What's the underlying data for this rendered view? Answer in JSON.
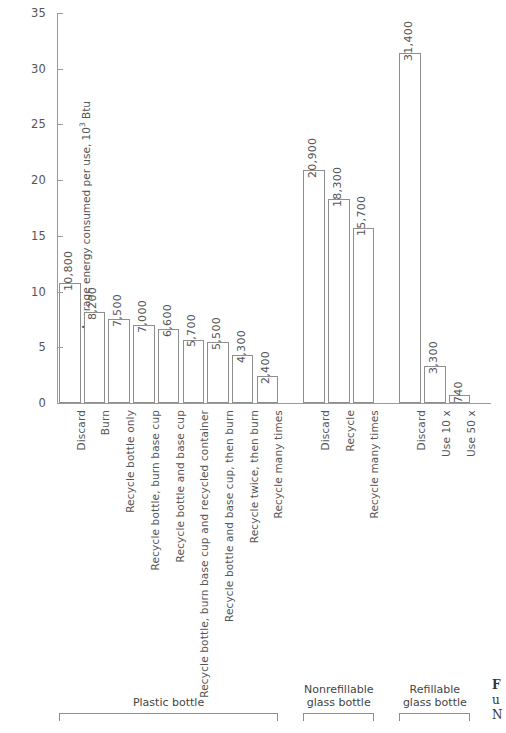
{
  "chart_data": {
    "type": "bar",
    "title": "",
    "xlabel": "",
    "ylabel": "Average energy consumed per use, 10³ Btu",
    "ylim": [
      0,
      35
    ],
    "yticks": [
      0,
      5,
      10,
      15,
      20,
      25,
      30,
      35
    ],
    "ytick_labels": [
      "0",
      "5",
      "10",
      "15",
      "20",
      "25",
      "30",
      "35"
    ],
    "grid": false,
    "legend": "none",
    "value_label_unit": "Btu (values shown in Btu, axis in 10³ Btu)",
    "categories": [
      "Discard",
      "Burn",
      "Recycle bottle only",
      "Recycle bottle, burn base cup",
      "Recycle bottle and base cup",
      "Recycle bottle, burn base cup and recycled container",
      "Recycle bottle and base cup, then burn",
      "Recycle twice, then burn",
      "Recycle many times",
      "Discard",
      "Recycle",
      "Recycle many times",
      "Discard",
      "Use 10 x",
      "Use 50 x"
    ],
    "values": [
      10800,
      8200,
      7500,
      7000,
      6600,
      5700,
      5500,
      4300,
      2400,
      20900,
      18300,
      15700,
      31400,
      3300,
      740
    ],
    "value_labels": [
      "10,800",
      "8,200",
      "7,500",
      "7,000",
      "6,600",
      "5,700",
      "5,500",
      "4,300",
      "2,400",
      "20,900",
      "18,300",
      "15,700",
      "31,400",
      "3,300",
      "740"
    ],
    "groups": [
      {
        "label": "Plastic bottle",
        "start_index": 0,
        "end_index": 8
      },
      {
        "label": "Nonrefillable\nglass bottle",
        "start_index": 9,
        "end_index": 11
      },
      {
        "label": "Refillable\nglass bottle",
        "start_index": 12,
        "end_index": 14
      }
    ]
  },
  "axis": {
    "y_title_main": "Average energy consumed per use, 10",
    "y_title_sup": "3",
    "y_title_tail": " Btu"
  },
  "groups_display": [
    {
      "label_line1": "Plastic bottle",
      "label_line2": ""
    },
    {
      "label_line1": "Nonrefillable",
      "label_line2": "glass bottle"
    },
    {
      "label_line1": "Refillable",
      "label_line2": "glass bottle"
    }
  ],
  "caption": {
    "line1": "F",
    "line2": "u",
    "line3": "N"
  },
  "colors": {
    "bar_fill": "#ffffff",
    "bar_stroke": "#8e8e8e",
    "axis": "#9a9a9a",
    "text": "#555555",
    "background": "#ffffff"
  }
}
